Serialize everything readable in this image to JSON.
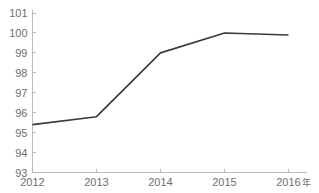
{
  "chart_data": {
    "type": "line",
    "title": "",
    "subtitle": "",
    "xlabel": "年",
    "ylabel": "",
    "categories": [
      "2012",
      "2013",
      "2014",
      "2015",
      "2016"
    ],
    "x": [
      2012,
      2013,
      2014,
      2015,
      2016
    ],
    "values": [
      95.4,
      95.8,
      99.0,
      100.0,
      99.9
    ],
    "series": [
      {
        "name": "",
        "values": [
          95.4,
          95.8,
          99.0,
          100.0,
          99.9
        ]
      }
    ],
    "xlim": [
      2012,
      2016
    ],
    "ylim": [
      93,
      101
    ],
    "y_ticks": [
      93,
      94,
      95,
      96,
      97,
      98,
      99,
      100,
      101
    ],
    "y_tick_labels": [
      "93",
      "94",
      "95",
      "96",
      "97",
      "98",
      "99",
      "100",
      "101"
    ],
    "x_ticks": [
      2012,
      2013,
      2014,
      2015,
      2016
    ],
    "x_tick_labels": [
      "2012",
      "2013",
      "2014",
      "2015",
      "2016"
    ],
    "grid": false,
    "legend": false,
    "legend_position": "none",
    "markers": false,
    "annotations": [],
    "colors": {
      "line": "#3a3a3a",
      "axis": "#b9b9b9",
      "tick_text": "#6e6e6e",
      "background": "#ffffff"
    }
  }
}
